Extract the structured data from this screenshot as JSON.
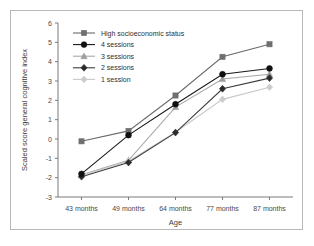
{
  "chart_data": {
    "type": "line",
    "title": "",
    "xlabel": "Age",
    "ylabel": "Scaled score general cognitive index",
    "categories": [
      "43 months",
      "49 months",
      "64 months",
      "77 months",
      "87 months"
    ],
    "ylim": [
      -3,
      6
    ],
    "yticks": [
      -3,
      -2,
      -1,
      0,
      1,
      2,
      3,
      4,
      5,
      6
    ],
    "ytick_labels": [
      "-3",
      "-2",
      "-1",
      "0",
      "1",
      "2",
      "3",
      "4",
      "5",
      "6"
    ],
    "grid": false,
    "legend_position": "top-left-inside",
    "series": [
      {
        "name": "High socioeconomic status",
        "marker": "square",
        "color": "#6b6b6b",
        "marker_color": "#6f6f6f",
        "values": [
          -0.12,
          0.42,
          2.25,
          4.25,
          4.9
        ]
      },
      {
        "name": "4 sessions",
        "marker": "circle",
        "color": "#1a1a1a",
        "marker_color": "#101010",
        "values": [
          -1.8,
          0.2,
          1.8,
          3.35,
          3.65
        ]
      },
      {
        "name": "3 sessions",
        "marker": "triangle",
        "color": "#a8a8a8",
        "marker_color": "#9e9e9e",
        "values": [
          -1.85,
          -1.1,
          1.65,
          3.1,
          3.35
        ]
      },
      {
        "name": "2 sessions",
        "marker": "diamond",
        "color": "#3d3d3d",
        "marker_color": "#2b2b2b",
        "values": [
          -1.95,
          -1.22,
          0.33,
          2.6,
          3.15
        ]
      },
      {
        "name": "1 session",
        "marker": "diamond-light",
        "color": "#c9c9c9",
        "marker_color": "#cccccc",
        "values": [
          -1.88,
          -1.15,
          0.35,
          2.05,
          2.68
        ]
      }
    ]
  },
  "figure": {
    "border_color": "#b9b9b9",
    "background": "#ffffff"
  }
}
